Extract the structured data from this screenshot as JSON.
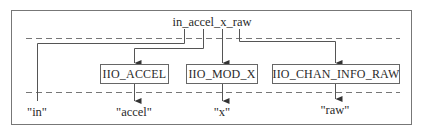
{
  "diagram": {
    "title": "in_accel_x_raw",
    "boxes": [
      {
        "id": "iio-accel",
        "label": "IIO_ACCEL"
      },
      {
        "id": "iio-mod-x",
        "label": "IIO_MOD_X"
      },
      {
        "id": "iio-chan-info-raw",
        "label": "IIO_CHAN_INFO_RAW"
      }
    ],
    "outputs": [
      {
        "id": "in",
        "label": "\"in\""
      },
      {
        "id": "accel",
        "label": "\"accel\""
      },
      {
        "id": "x",
        "label": "\"x\""
      },
      {
        "id": "raw",
        "label": "\"raw\""
      }
    ],
    "colors": {
      "line": "#555555",
      "frame": "#666666",
      "text": "#2a2a2a",
      "background": "#ffffff"
    }
  }
}
